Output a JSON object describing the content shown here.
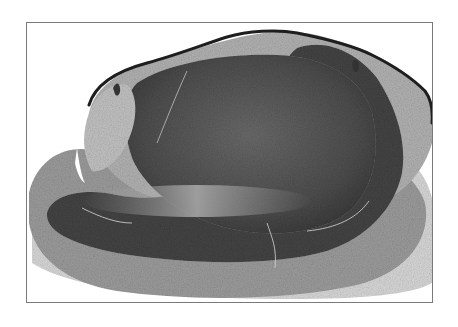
{
  "figure": {
    "colors": {
      "background": "#ffffff",
      "frame": "#7a7a7a",
      "outer_zone": "#a8a8a8",
      "pale_zone": "#c4c4c4",
      "dark_band": "#3e3e3e",
      "core": "#5a5a5a",
      "epidermis": "#1e1e1e"
    }
  }
}
